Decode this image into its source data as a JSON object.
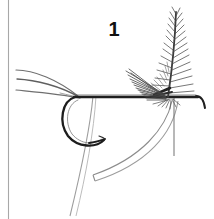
{
  "figure": {
    "kind": "fly-tying-instruction-illustration",
    "step_label": "1",
    "background_color": "#ffffff",
    "ink_color": "#1a1a1a",
    "light_ink_color": "#8a8a8a",
    "border_line_color": "#9a9a9a",
    "components": {
      "page_border_line": {
        "name": "vertical-page-border",
        "x": 8,
        "y_start": 0,
        "y_end": 219,
        "color": "#a0a0a0"
      },
      "hook_shank": {
        "name": "hook-shank",
        "from_x": 74,
        "to_x": 200,
        "y": 98,
        "color": "#222222"
      },
      "hook_eye": {
        "name": "hook-eye",
        "x": 200,
        "y": 98,
        "turn_down_to_y": 108
      },
      "hook_bend": {
        "name": "hook-bend",
        "start_x": 74,
        "start_y": 98,
        "lowest_y": 146,
        "point_x": 104,
        "point_y": 140
      },
      "hook_point_barb": {
        "name": "hook-point-and-barb",
        "tip_x": 104,
        "tip_y": 140
      },
      "tail_fibers": {
        "name": "tail-fibers",
        "count": 3,
        "origin_x": 78,
        "origin_y": 97,
        "tip_xs": [
          16,
          18,
          17
        ],
        "tip_ys": [
          70,
          78,
          90
        ],
        "color": "#6e6e6e"
      },
      "wing_hackle": {
        "name": "wing-hackle-feather",
        "tie_in_x": 168,
        "tie_in_y": 97,
        "tip_x": 176,
        "tip_y": 10,
        "fan_spread_left_x": 126,
        "fan_spread_left_y": 72,
        "color": "#3a3a3a"
      },
      "thread_vertical": {
        "name": "tying-thread",
        "x_top": 174,
        "y_top": 98,
        "x_bottom": 174,
        "y_bottom": 156,
        "color": "#7a7a7a"
      },
      "thread_bobbin_strand": {
        "name": "bobbin-thread-strand",
        "x_top": 92,
        "y_top": 98,
        "x_bottom": 70,
        "y_bottom": 215,
        "color": "#9a9a9a"
      },
      "tinsel_ribbon": {
        "name": "tinsel-ribbon-strip",
        "x_top": 173,
        "y_top": 100,
        "x_bottom": 92,
        "y_bottom": 178,
        "width_px": 7,
        "color": "#8f8f8f"
      }
    }
  }
}
